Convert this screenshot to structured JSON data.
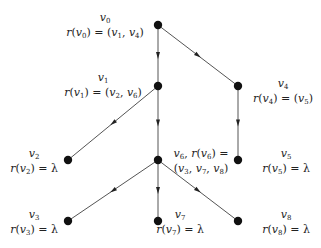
{
  "diagram": {
    "type": "tree",
    "nodes": [
      {
        "id": "v0",
        "x": 158,
        "y": 25,
        "name": "v0",
        "rule": "r(v0) = (v1, v4)"
      },
      {
        "id": "v1",
        "x": 158,
        "y": 86,
        "name": "v1",
        "rule": "r(v1) = (v2, v6)"
      },
      {
        "id": "v4",
        "x": 238,
        "y": 86,
        "name": "v4",
        "rule": "r(v4) = (v5)"
      },
      {
        "id": "v2",
        "x": 68,
        "y": 160,
        "name": "v2",
        "rule": "r(v2) = λ"
      },
      {
        "id": "v6",
        "x": 158,
        "y": 160,
        "name": "v6",
        "rule": "v6, r(v6) = (v3, v7, v8)"
      },
      {
        "id": "v5",
        "x": 238,
        "y": 160,
        "name": "v5",
        "rule": "r(v5) = λ"
      },
      {
        "id": "v3",
        "x": 68,
        "y": 221,
        "name": "v3",
        "rule": "r(v3) = λ"
      },
      {
        "id": "v7",
        "x": 158,
        "y": 221,
        "name": "v7",
        "rule": "r(v7) = λ"
      },
      {
        "id": "v8",
        "x": 238,
        "y": 221,
        "name": "v8",
        "rule": "r(v8) = λ"
      }
    ],
    "edges": [
      {
        "from": "v0",
        "to": "v1"
      },
      {
        "from": "v0",
        "to": "v4"
      },
      {
        "from": "v1",
        "to": "v2"
      },
      {
        "from": "v1",
        "to": "v6"
      },
      {
        "from": "v4",
        "to": "v5"
      },
      {
        "from": "v6",
        "to": "v3"
      },
      {
        "from": "v6",
        "to": "v7"
      },
      {
        "from": "v6",
        "to": "v8"
      }
    ],
    "colors": {
      "node": "#111111",
      "edge": "#555555",
      "text": "#222222"
    }
  }
}
